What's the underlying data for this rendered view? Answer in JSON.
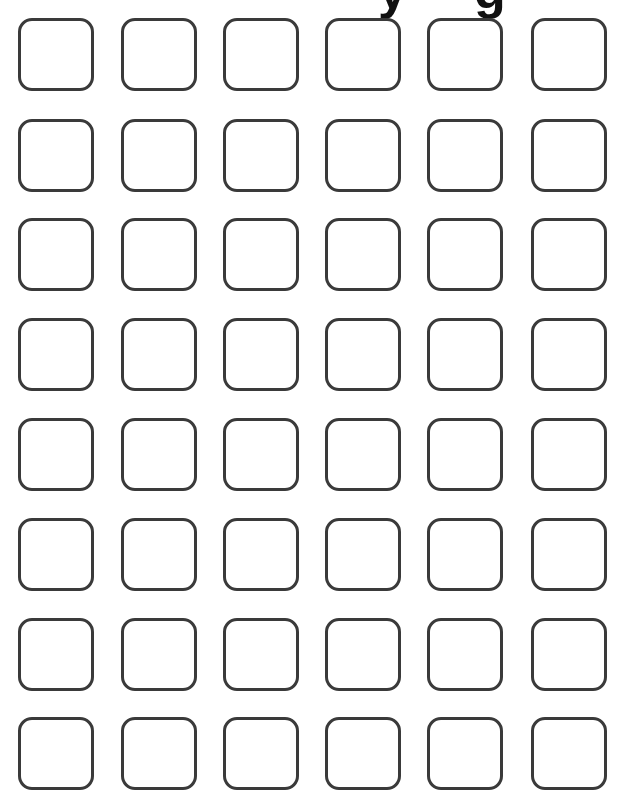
{
  "title_fragment": {
    "left_glyph": "y",
    "right_glyph": "g"
  },
  "grid": {
    "rows": 8,
    "columns": 6,
    "box_color": "#3a3a3a",
    "column_x": [
      18,
      121,
      223,
      325,
      427,
      531
    ],
    "row_y": [
      18,
      119,
      218,
      318,
      418,
      518,
      618,
      717
    ]
  }
}
